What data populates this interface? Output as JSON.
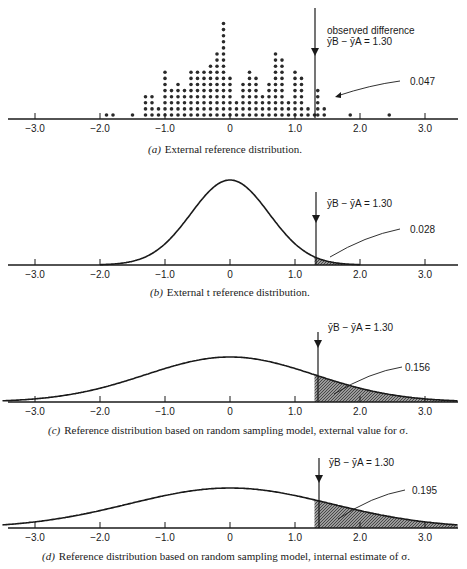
{
  "chart_data": [
    {
      "id": "a",
      "type": "scatter",
      "subtype": "dot-histogram",
      "caption_letter": "(a)",
      "caption": "External reference distribution.",
      "xticks": [
        "-3.0",
        "-2.0",
        "-1.0",
        "0",
        "1.0",
        "2.0",
        "3.0"
      ],
      "xlim": [
        -3.5,
        3.5
      ],
      "observed_label": "observed difference",
      "observed_formula": "ȳB − ȳA = 1.30",
      "observed_value": 1.3,
      "tail_probability": "0.047",
      "dots": [
        {
          "x": -1.9,
          "n": 1
        },
        {
          "x": -1.8,
          "n": 1
        },
        {
          "x": -1.5,
          "n": 1
        },
        {
          "x": -1.3,
          "n": 4
        },
        {
          "x": -1.2,
          "n": 4
        },
        {
          "x": -1.1,
          "n": 2
        },
        {
          "x": -1.0,
          "n": 8
        },
        {
          "x": -0.9,
          "n": 5
        },
        {
          "x": -0.8,
          "n": 6
        },
        {
          "x": -0.7,
          "n": 5
        },
        {
          "x": -0.6,
          "n": 8
        },
        {
          "x": -0.5,
          "n": 8
        },
        {
          "x": -0.4,
          "n": 8
        },
        {
          "x": -0.3,
          "n": 9
        },
        {
          "x": -0.2,
          "n": 11
        },
        {
          "x": -0.1,
          "n": 16
        },
        {
          "x": 0.0,
          "n": 7
        },
        {
          "x": 0.1,
          "n": 3
        },
        {
          "x": 0.2,
          "n": 6
        },
        {
          "x": 0.3,
          "n": 8
        },
        {
          "x": 0.4,
          "n": 7
        },
        {
          "x": 0.5,
          "n": 4
        },
        {
          "x": 0.6,
          "n": 6
        },
        {
          "x": 0.7,
          "n": 11
        },
        {
          "x": 0.8,
          "n": 10
        },
        {
          "x": 0.9,
          "n": 3
        },
        {
          "x": 1.0,
          "n": 8
        },
        {
          "x": 1.1,
          "n": 7
        },
        {
          "x": 1.2,
          "n": 2
        },
        {
          "x": 1.3,
          "n": 1
        },
        {
          "x": 1.35,
          "n": 5
        },
        {
          "x": 1.45,
          "n": 2
        },
        {
          "x": 1.85,
          "n": 1
        },
        {
          "x": 2.45,
          "n": 1
        }
      ]
    },
    {
      "id": "b",
      "type": "area",
      "caption_letter": "(b)",
      "caption": "External t reference distribution.",
      "xticks": [
        "-3.0",
        "-2.0",
        "-1.0",
        "0",
        "1.0",
        "2.0",
        "3.0"
      ],
      "xlim": [
        -3.5,
        3.5
      ],
      "observed_formula": "ȳB − ȳA = 1.30",
      "observed_value": 1.3,
      "tail_probability": "0.028",
      "curve": {
        "center": 0,
        "spread": 0.6,
        "peak_px": 85,
        "support": [
          -2.0,
          2.0
        ]
      }
    },
    {
      "id": "c",
      "type": "area",
      "caption_letter": "(c)",
      "caption": "Reference distribution based on random sampling model, external value for σ.",
      "xticks": [
        "-3.0",
        "-2.0",
        "-1.0",
        "0",
        "1.0",
        "2.0",
        "3.0"
      ],
      "xlim": [
        -3.5,
        3.5
      ],
      "observed_formula": "ȳB − ȳA = 1.30",
      "observed_value": 1.3,
      "tail_probability": "0.156",
      "curve": {
        "center": 0,
        "spread": 1.3,
        "peak_px": 45,
        "support": [
          -3.5,
          3.5
        ]
      }
    },
    {
      "id": "d",
      "type": "area",
      "caption_letter": "(d)",
      "caption": "Reference distribution based on random sampling model, internal estimate of σ.",
      "xticks": [
        "-3.0",
        "-2.0",
        "-1.0",
        "0",
        "1.0",
        "2.0",
        "3.0"
      ],
      "xlim": [
        -3.5,
        3.5
      ],
      "observed_formula": "ȳB − ȳA = 1.30",
      "observed_value": 1.3,
      "tail_probability": "0.195",
      "curve": {
        "center": 0,
        "spread": 1.55,
        "peak_px": 40,
        "support": [
          -3.5,
          3.5
        ]
      }
    }
  ]
}
